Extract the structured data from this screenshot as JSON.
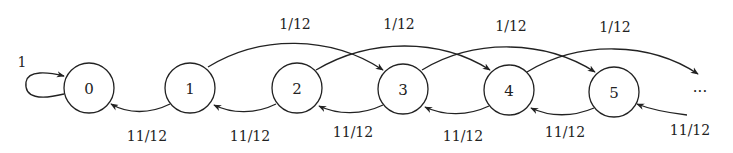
{
  "diagram": {
    "type": "markov-chain",
    "nodes": [
      {
        "id": "0",
        "label": "0",
        "cx": 89,
        "cy": 88
      },
      {
        "id": "1",
        "label": "1",
        "cx": 190,
        "cy": 88
      },
      {
        "id": "2",
        "label": "2",
        "cx": 297,
        "cy": 88
      },
      {
        "id": "3",
        "label": "3",
        "cx": 403,
        "cy": 89
      },
      {
        "id": "4",
        "label": "4",
        "cx": 509,
        "cy": 90
      },
      {
        "id": "5",
        "label": "5",
        "cx": 614,
        "cy": 92
      }
    ],
    "continuation": "···",
    "self_loop": {
      "from": "0",
      "to": "0",
      "label": "1"
    },
    "forward_edges": [
      {
        "from": "1",
        "to": "3",
        "label": "1/12"
      },
      {
        "from": "2",
        "to": "4",
        "label": "1/12"
      },
      {
        "from": "3",
        "to": "5",
        "label": "1/12"
      },
      {
        "from": "4",
        "to": "…",
        "label": "1/12"
      }
    ],
    "backward_edges": [
      {
        "from": "1",
        "to": "0",
        "label": "11/12"
      },
      {
        "from": "2",
        "to": "1",
        "label": "11/12"
      },
      {
        "from": "3",
        "to": "2",
        "label": "11/12"
      },
      {
        "from": "4",
        "to": "3",
        "label": "11/12"
      },
      {
        "from": "5",
        "to": "4",
        "label": "11/12"
      },
      {
        "from": "…",
        "to": "5",
        "label": "11/12"
      }
    ]
  },
  "labels": {
    "self_loop": "1",
    "fwd_1_3": "1/12",
    "fwd_2_4": "1/12",
    "fwd_3_5": "1/12",
    "fwd_4_more": "1/12",
    "back_1_0": "11/12",
    "back_2_1": "11/12",
    "back_3_2": "11/12",
    "back_4_3": "11/12",
    "back_5_4": "11/12",
    "back_more_5": "11/12",
    "node_0": "0",
    "node_1": "1",
    "node_2": "2",
    "node_3": "3",
    "node_4": "4",
    "node_5": "5",
    "ellipsis": "···"
  }
}
